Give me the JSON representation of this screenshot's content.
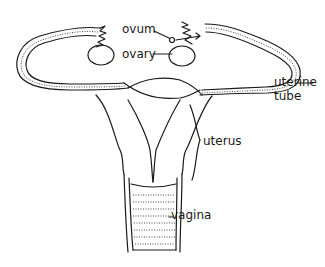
{
  "diagram": {
    "labels": {
      "ovum": "ovum",
      "ovary": "ovary",
      "uterine_tube_line1": "uterine",
      "uterine_tube_line2": "tube",
      "uterus": "uterus",
      "vagina": "vagina"
    },
    "colors": {
      "line": "#1a1a1a",
      "background": "#ffffff"
    }
  }
}
